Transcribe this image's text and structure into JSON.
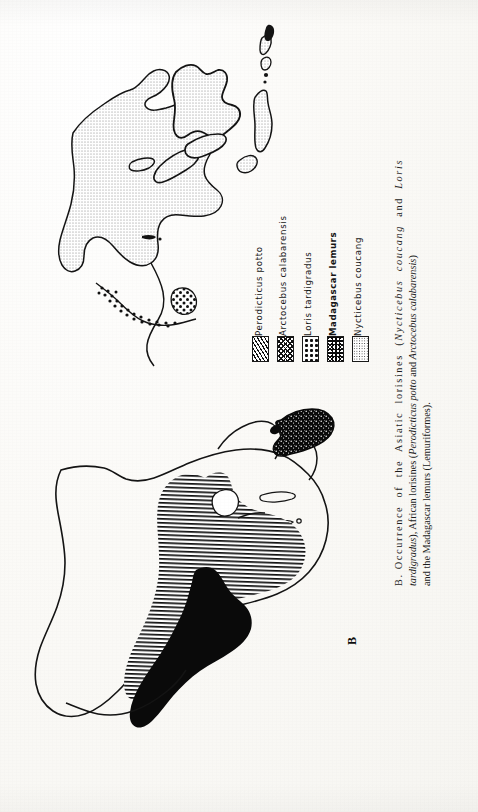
{
  "figure": {
    "panel_label": "B",
    "caption_lines": [
      "B. Occurrence  of  the  Asiatic  lorisines  (Nycticebus  coucang  and  Loris",
      "tardigradus), African lorisines (Perodicticus potto and Arctocebus calabarensis)",
      "and the Madagascar lemurs (Lemuriformes)."
    ],
    "caption_full": "B. Occurrence of the Asiatic lorisines (Nycticebus coucang and Loris tardigradus), African lorisines (Perodicticus potto and Arctocebus calabarensis) and the Madagascar lemurs (Lemuriformes)."
  },
  "legend": {
    "entries": [
      {
        "label": "Perodicticus  potto",
        "pattern": "diagonal-hatch",
        "swatch_name": "swatch-diagonal-hatch",
        "bold": false,
        "color": "#111111"
      },
      {
        "label": "Arctocebus  calabarensis",
        "pattern": "cross-hatch",
        "swatch_name": "swatch-cross-hatch",
        "bold": false,
        "color": "#111111"
      },
      {
        "label": "Loris  tardigradus",
        "pattern": "coarse-dots",
        "swatch_name": "swatch-coarse-dots",
        "bold": false,
        "color": "#111111"
      },
      {
        "label": "Madagascar  lemurs",
        "pattern": "dense-speckle",
        "swatch_name": "swatch-dense-speckle",
        "bold": true,
        "color": "#0b0b0b"
      },
      {
        "label": "Nycticebus  coucang",
        "pattern": "light-stipple",
        "swatch_name": "swatch-light-stipple",
        "bold": false,
        "color": "#333333"
      }
    ]
  },
  "map": {
    "description": "Outline map of Africa, southern Asia and the Indian Ocean, printed sideways on the page",
    "ink_color": "#141414",
    "paper_color": "#fbfaf7",
    "regions": [
      {
        "name": "mainland-southeast-asia",
        "fill": "light-stipple",
        "species": "Nycticebus coucang"
      },
      {
        "name": "borneo",
        "fill": "light-stipple",
        "species": "Nycticebus coucang"
      },
      {
        "name": "sumatra-java",
        "fill": "light-stipple",
        "species": "Nycticebus coucang"
      },
      {
        "name": "philippines",
        "fill": "light-stipple",
        "species": "Nycticebus coucang"
      },
      {
        "name": "southwest-india",
        "fill": "coarse-dots",
        "species": "Loris tardigradus"
      },
      {
        "name": "sri-lanka",
        "fill": "coarse-dots",
        "species": "Loris tardigradus"
      },
      {
        "name": "madagascar",
        "fill": "dense-speckle",
        "species": "Madagascar lemurs"
      },
      {
        "name": "equatorial-africa",
        "fill": "diagonal-hatch",
        "species": "Perodicticus potto"
      },
      {
        "name": "west-africa-congo",
        "fill": "solid-black",
        "species": "Arctocebus calabarensis"
      }
    ]
  }
}
